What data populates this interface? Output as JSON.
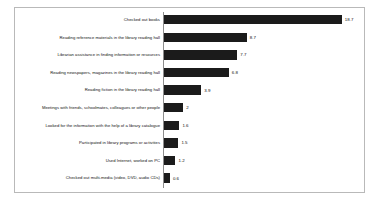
{
  "chart_data": {
    "type": "bar",
    "orientation": "horizontal",
    "title": "",
    "subtitle": "",
    "xlabel": "",
    "ylabel": "",
    "grid": false,
    "legend": false,
    "legend_position": "none",
    "xlim": [
      0,
      20
    ],
    "bar_color": "#1b1b1b",
    "axis_color": "#8d8d8d",
    "border_color": "#b9b9b9",
    "background_color": "#ffffff",
    "value_label_position": "outside-end",
    "categories": [
      "Checked out books",
      "Reading reference materials in the library reading hall",
      "Librarian assistance in finding information or resources",
      "Reading newspapers, magazines in the library reading hall",
      "Reading fiction in the library reading hall",
      "Meetings with friends, schoolmates, colleagues or other people",
      "Looked for the information with the help of a library catalogue",
      "Participated in library programs or activities",
      "Used Internet, worked on PC",
      "Checked out multi-media (video, DVD, audio CDs)"
    ],
    "values": [
      18.7,
      8.7,
      7.7,
      6.8,
      3.9,
      2,
      1.6,
      1.5,
      1.2,
      0.6
    ],
    "value_labels": [
      "18.7",
      "8.7",
      "7.7",
      "6.8",
      "3.9",
      "2",
      "1.6",
      "1.5",
      "1.2",
      "0.6"
    ]
  }
}
